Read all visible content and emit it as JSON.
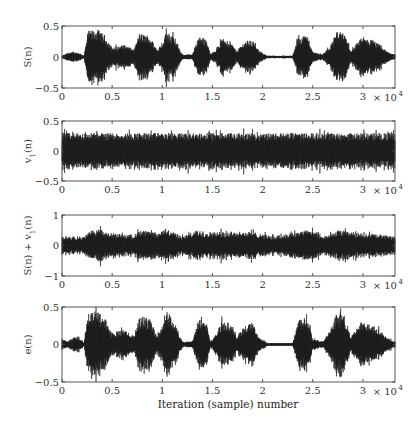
{
  "chart_data": [
    {
      "type": "line",
      "ylabel": "S(n)",
      "ylim": [
        -0.5,
        0.5
      ],
      "yticks": [
        "0.5",
        "0",
        "-0.5"
      ],
      "xlim": [
        0,
        3.32
      ],
      "xticks": [
        "0",
        "0.5",
        "1",
        "1.5",
        "2",
        "2.5",
        "3"
      ],
      "x_multiplier": "× 10^4",
      "description": "Clean speech signal with bursts of voiced segments",
      "envelope": [
        [
          0,
          0.02
        ],
        [
          0.08,
          0.08
        ],
        [
          0.17,
          0.07
        ],
        [
          0.22,
          0.02
        ],
        [
          0.26,
          0.42
        ],
        [
          0.35,
          0.45
        ],
        [
          0.43,
          0.35
        ],
        [
          0.5,
          0.15
        ],
        [
          0.62,
          0.2
        ],
        [
          0.72,
          0.12
        ],
        [
          0.77,
          0.38
        ],
        [
          0.87,
          0.35
        ],
        [
          0.95,
          0.12
        ],
        [
          1.0,
          0.25
        ],
        [
          1.05,
          0.45
        ],
        [
          1.12,
          0.3
        ],
        [
          1.2,
          0.04
        ],
        [
          1.3,
          0.04
        ],
        [
          1.36,
          0.34
        ],
        [
          1.44,
          0.3
        ],
        [
          1.48,
          0.04
        ],
        [
          1.52,
          0.1
        ],
        [
          1.6,
          0.3
        ],
        [
          1.68,
          0.25
        ],
        [
          1.74,
          0.1
        ],
        [
          1.82,
          0.25
        ],
        [
          1.9,
          0.28
        ],
        [
          1.96,
          0.1
        ],
        [
          2.05,
          0.02
        ],
        [
          2.3,
          0.02
        ],
        [
          2.36,
          0.35
        ],
        [
          2.45,
          0.35
        ],
        [
          2.5,
          0.08
        ],
        [
          2.6,
          0.04
        ],
        [
          2.68,
          0.2
        ],
        [
          2.74,
          0.42
        ],
        [
          2.82,
          0.38
        ],
        [
          2.88,
          0.1
        ],
        [
          2.98,
          0.3
        ],
        [
          3.1,
          0.28
        ],
        [
          3.25,
          0.08
        ],
        [
          3.32,
          0.04
        ]
      ]
    },
    {
      "type": "line",
      "ylabel": "v1(n)",
      "ylim": [
        -0.5,
        0.5
      ],
      "yticks": [
        "0.5",
        "0",
        "-0.5"
      ],
      "xlim": [
        0,
        3.32
      ],
      "xticks": [
        "0",
        "0.5",
        "1",
        "1.5",
        "2",
        "2.5",
        "3"
      ],
      "x_multiplier": "× 10^4",
      "description": "Stationary noise, amplitude approx ±0.3 with peaks near ±0.4",
      "envelope": [
        [
          0,
          0.3
        ],
        [
          3.32,
          0.3
        ]
      ]
    },
    {
      "type": "line",
      "ylabel": "S(n) + v1(n)",
      "ylim": [
        -1,
        1
      ],
      "yticks": [
        "1",
        "0",
        "-1"
      ],
      "xlim": [
        0,
        3.32
      ],
      "xticks": [
        "0",
        "0.5",
        "1",
        "1.5",
        "2",
        "2.5",
        "3"
      ],
      "x_multiplier": "× 10^4",
      "description": "Noisy speech: noise floor approx ±0.3 with speech bursts up to ±0.6",
      "envelope": [
        [
          0,
          0.3
        ],
        [
          0.22,
          0.3
        ],
        [
          0.3,
          0.5
        ],
        [
          0.38,
          0.55
        ],
        [
          0.45,
          0.4
        ],
        [
          0.7,
          0.35
        ],
        [
          0.8,
          0.5
        ],
        [
          0.95,
          0.4
        ],
        [
          1.05,
          0.55
        ],
        [
          1.2,
          0.3
        ],
        [
          1.35,
          0.5
        ],
        [
          1.45,
          0.45
        ],
        [
          1.6,
          0.45
        ],
        [
          1.9,
          0.45
        ],
        [
          2.1,
          0.3
        ],
        [
          2.35,
          0.45
        ],
        [
          2.45,
          0.55
        ],
        [
          2.6,
          0.3
        ],
        [
          2.78,
          0.5
        ],
        [
          3.0,
          0.4
        ],
        [
          3.32,
          0.3
        ]
      ]
    },
    {
      "type": "line",
      "ylabel": "e(n)",
      "ylim": [
        -0.5,
        0.5
      ],
      "yticks": [
        "0.5",
        "0",
        "-0.5"
      ],
      "xlim": [
        0,
        3.32
      ],
      "xticks": [
        "0",
        "0.5",
        "1",
        "1.5",
        "2",
        "2.5",
        "3"
      ],
      "x_multiplier": "× 10^4",
      "xlabel": "Iteration (sample) number",
      "description": "Recovered (error) signal closely resembling the clean speech S(n)",
      "envelope": [
        [
          0,
          0.08
        ],
        [
          0.05,
          0.04
        ],
        [
          0.12,
          0.1
        ],
        [
          0.18,
          0.08
        ],
        [
          0.22,
          0.03
        ],
        [
          0.26,
          0.42
        ],
        [
          0.35,
          0.45
        ],
        [
          0.43,
          0.35
        ],
        [
          0.5,
          0.15
        ],
        [
          0.62,
          0.2
        ],
        [
          0.72,
          0.12
        ],
        [
          0.77,
          0.38
        ],
        [
          0.87,
          0.35
        ],
        [
          0.95,
          0.12
        ],
        [
          1.0,
          0.25
        ],
        [
          1.05,
          0.45
        ],
        [
          1.12,
          0.3
        ],
        [
          1.2,
          0.04
        ],
        [
          1.3,
          0.04
        ],
        [
          1.36,
          0.34
        ],
        [
          1.44,
          0.3
        ],
        [
          1.48,
          0.04
        ],
        [
          1.52,
          0.1
        ],
        [
          1.6,
          0.33
        ],
        [
          1.68,
          0.28
        ],
        [
          1.74,
          0.1
        ],
        [
          1.82,
          0.25
        ],
        [
          1.9,
          0.3
        ],
        [
          1.96,
          0.1
        ],
        [
          2.05,
          0.02
        ],
        [
          2.3,
          0.02
        ],
        [
          2.36,
          0.35
        ],
        [
          2.45,
          0.38
        ],
        [
          2.5,
          0.08
        ],
        [
          2.6,
          0.04
        ],
        [
          2.68,
          0.2
        ],
        [
          2.74,
          0.42
        ],
        [
          2.82,
          0.38
        ],
        [
          2.88,
          0.1
        ],
        [
          2.98,
          0.3
        ],
        [
          3.1,
          0.28
        ],
        [
          3.25,
          0.08
        ],
        [
          3.32,
          0.04
        ]
      ]
    }
  ],
  "figure": {
    "xlabel": "Iteration (sample) number",
    "x_multiplier_base": "× 10",
    "x_multiplier_exp": "4",
    "panels": [
      {
        "ylabel_main": "S(n)",
        "ylabel_sub": ""
      },
      {
        "ylabel_main": "v",
        "ylabel_sub": "1",
        "ylabel_tail": "(n)"
      },
      {
        "ylabel_main": "S(n) + v",
        "ylabel_sub": "1",
        "ylabel_tail": "(n)"
      },
      {
        "ylabel_main": "e(n)",
        "ylabel_sub": ""
      }
    ]
  }
}
